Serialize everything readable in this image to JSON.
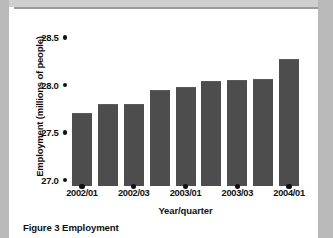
{
  "figure": {
    "caption": "Figure 3 Employment"
  },
  "chart_data": {
    "type": "bar",
    "title": "",
    "xlabel": "Year/quarter",
    "ylabel": "Employment (millions of people)",
    "categories": [
      "2002/01",
      "2002/02",
      "2002/03",
      "2002/04",
      "2003/01",
      "2003/02",
      "2003/03",
      "2003/04",
      "2004/01"
    ],
    "values": [
      27.76,
      27.85,
      27.85,
      28.0,
      28.03,
      28.1,
      28.11,
      28.12,
      28.33
    ],
    "ylim": [
      27.0,
      28.6
    ],
    "yticks": [
      "27.0",
      "27.5",
      "28.0",
      "28.5"
    ],
    "ytick_values": [
      27.0,
      27.5,
      28.0,
      28.5
    ],
    "xtick_labels": [
      "2002/01",
      "2002/03",
      "2003/01",
      "2003/03",
      "2004/01"
    ],
    "xtick_indices": [
      0,
      2,
      4,
      6,
      8
    ],
    "grid": false,
    "legend": false,
    "bar_color": "#4d4d4d",
    "axis_color": "#111111",
    "background_color": "#ffffff"
  }
}
